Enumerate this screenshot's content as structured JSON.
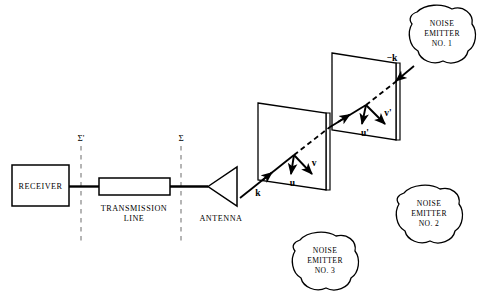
{
  "figure": {
    "background_color": "#ffffff",
    "line_color": "#000000",
    "sigma_line_color": "#8a8a8a"
  },
  "blocks": {
    "receiver": {
      "label": "RECEIVER"
    },
    "transmission_line": {
      "label_line1": "TRANSMISSION",
      "label_line2": "LINE"
    },
    "antenna": {
      "label": "ANTENNA"
    }
  },
  "reference_planes": {
    "sigma_prime": {
      "label": "Σ'"
    },
    "sigma": {
      "label": "Σ"
    }
  },
  "vectors": {
    "k": {
      "label": "k"
    },
    "u": {
      "label": "u"
    },
    "v": {
      "label": "v"
    },
    "u_prime": {
      "label": "u'"
    },
    "v_prime": {
      "label": "v'"
    },
    "minus_k": {
      "label": "−k"
    }
  },
  "noise_emitters": [
    {
      "line1": "NOISE",
      "line2": "EMITTER",
      "line3": "NO. 1"
    },
    {
      "line1": "NOISE",
      "line2": "EMITTER",
      "line3": "NO. 2"
    },
    {
      "line1": "NOISE",
      "line2": "EMITTER",
      "line3": "NO. 3"
    }
  ]
}
